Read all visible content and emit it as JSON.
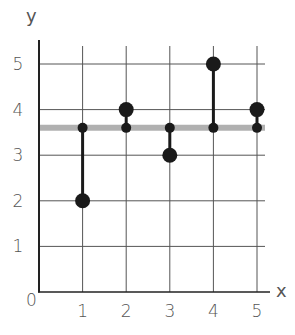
{
  "chart_data": {
    "type": "scatter",
    "title": "",
    "xlabel": "x",
    "ylabel": "y",
    "origin_label": "0",
    "x_ticks": [
      "1",
      "2",
      "3",
      "4",
      "5"
    ],
    "y_ticks": [
      "1",
      "2",
      "3",
      "4",
      "5"
    ],
    "xlim": [
      0,
      5.2
    ],
    "ylim": [
      0,
      5.3
    ],
    "grid": true,
    "legend": null,
    "points": [
      {
        "x": 1,
        "y": 2
      },
      {
        "x": 2,
        "y": 4
      },
      {
        "x": 3,
        "y": 3
      },
      {
        "x": 4,
        "y": 5
      },
      {
        "x": 5,
        "y": 4
      }
    ],
    "mean_line": {
      "y": 3.6,
      "color": "#b0b0b0"
    },
    "residuals": [
      {
        "x": 1,
        "from": 3.6,
        "to": 2
      },
      {
        "x": 2,
        "from": 3.6,
        "to": 4
      },
      {
        "x": 3,
        "from": 3.6,
        "to": 3
      },
      {
        "x": 4,
        "from": 3.6,
        "to": 5
      },
      {
        "x": 5,
        "from": 3.6,
        "to": 4
      }
    ],
    "colors": {
      "points": "#1a1a1a",
      "grid": "#555555",
      "axis": "#222222",
      "mean_line": "#b0b0b0"
    }
  }
}
